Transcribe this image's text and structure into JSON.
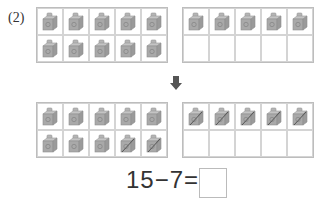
{
  "problem_label": "(2)",
  "equation": {
    "text": "15−7=",
    "answer": ""
  },
  "colors": {
    "cube": "#a9a9a9",
    "grid_border": "#bdbdbd",
    "arrow": "#555555"
  },
  "top_row": {
    "left_grid": {
      "filled": 10,
      "crossed": []
    },
    "right_grid": {
      "filled": 5,
      "crossed": []
    }
  },
  "arrow_icon": "down-arrow-icon",
  "bottom_row": {
    "left_grid": {
      "filled": 10,
      "crossed": [
        8,
        9
      ]
    },
    "right_grid": {
      "filled": 5,
      "crossed": [
        0,
        1,
        2,
        3,
        4
      ]
    }
  }
}
